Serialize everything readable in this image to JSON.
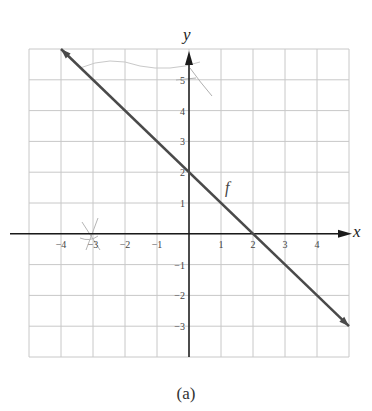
{
  "chart_data": {
    "type": "line",
    "title": "",
    "caption": "(a)",
    "xlabel": "x",
    "ylabel": "y",
    "xlim": [
      -5,
      5
    ],
    "ylim": [
      -4,
      6
    ],
    "grid": true,
    "x_ticks": [
      -4,
      -3,
      -2,
      -1,
      1,
      2,
      3,
      4
    ],
    "x_tick_labels": [
      "−4",
      "−3",
      "−2",
      "−1",
      "1",
      "2",
      "3",
      "4"
    ],
    "y_ticks": [
      5,
      4,
      3,
      2,
      1,
      -1,
      -2,
      -3
    ],
    "y_tick_labels": [
      "5",
      "4",
      "3",
      "2",
      "1",
      "−1",
      "−2",
      "−3"
    ],
    "series": [
      {
        "name": "f",
        "equation": "y = -x + 2",
        "x": [
          -4,
          5
        ],
        "y": [
          6,
          -3
        ],
        "arrows": "both",
        "label_position": [
          1.3,
          1.5
        ]
      }
    ],
    "colors": {
      "line": "#4a4a4a",
      "axes": "#1a1a1a",
      "grid": "#c8c8c8"
    }
  },
  "caption": "(a)"
}
